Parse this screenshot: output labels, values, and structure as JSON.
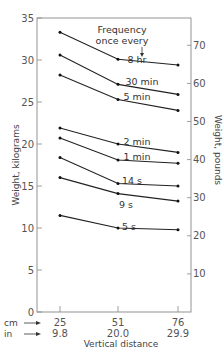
{
  "chart_data": {
    "type": "line",
    "title": "",
    "annotation": {
      "line1": "Frequency",
      "line2": "once every"
    },
    "xlabel": "Vertical distance",
    "ylabel_left": "Weight, kilograms",
    "ylabel_right": "Weight, pounds",
    "x_rows": [
      {
        "unit": "cm",
        "values": [
          "25",
          "51",
          "76"
        ]
      },
      {
        "unit": "in",
        "values": [
          "9.8",
          "20.0",
          "29.9"
        ]
      }
    ],
    "x": [
      25,
      51,
      76
    ],
    "ylim_left": [
      0,
      35
    ],
    "yticks_left": [
      0,
      5,
      10,
      15,
      20,
      25,
      30,
      35
    ],
    "yticks_right": [
      10,
      20,
      30,
      40,
      50,
      60,
      70
    ],
    "grid": false,
    "series": [
      {
        "name": "8 hr",
        "values": [
          33.3,
          30.1,
          29.4
        ]
      },
      {
        "name": "30 min",
        "values": [
          30.6,
          27.1,
          25.9
        ]
      },
      {
        "name": "5 min",
        "values": [
          28.2,
          25.3,
          24.0
        ]
      },
      {
        "name": "2 min",
        "values": [
          21.9,
          20.0,
          19.0
        ]
      },
      {
        "name": "1 min",
        "values": [
          20.7,
          18.1,
          17.7
        ]
      },
      {
        "name": "14 s",
        "values": [
          18.4,
          15.3,
          15.0
        ]
      },
      {
        "name": "9 s",
        "values": [
          16.0,
          14.1,
          13.2
        ]
      },
      {
        "name": "5 s",
        "values": [
          11.5,
          10.0,
          9.8
        ]
      }
    ]
  }
}
